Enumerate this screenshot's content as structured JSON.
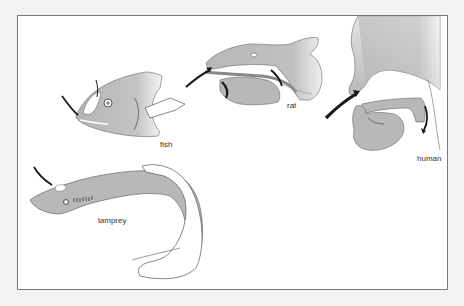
{
  "figure": {
    "type": "comparative anatomy diagram",
    "panels": [
      {
        "id": "fish",
        "label": "fish"
      },
      {
        "id": "rat",
        "label": "rat"
      },
      {
        "id": "human",
        "label": "human"
      },
      {
        "id": "lamprey",
        "label": "lamprey"
      }
    ],
    "colors": {
      "tissue_fill": "#b9b9b9",
      "tissue_light": "#d8d8d8",
      "outline": "#555555",
      "arrow": "#1a1a1a",
      "frame": "#7a7a7a",
      "background": "#ffffff"
    },
    "icons": {
      "airflow_arrow": "black-curved-arrow"
    }
  }
}
